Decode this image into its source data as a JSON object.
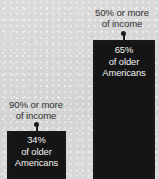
{
  "chart_data": {
    "type": "bar",
    "title": "",
    "subtitle": "",
    "xlabel": "",
    "ylabel": "",
    "grid": false,
    "legend_position": "none",
    "categories": [
      "90% or more of income",
      "50% or more of income"
    ],
    "values": [
      34,
      65
    ],
    "value_unit": "percent",
    "annotations": [
      "90% or more of income — 34% of older Americans",
      "50% or more of income — 65% of older Americans"
    ],
    "series": [
      {
        "name": "Share of older Americans",
        "values": [
          34,
          65
        ]
      }
    ],
    "bars": [
      {
        "id": "left",
        "callout": {
          "line1": "90% or more",
          "line2": "of income"
        },
        "value_label": "34%",
        "group_line1": "of older",
        "group_line2": "Americans",
        "value": 34
      },
      {
        "id": "right",
        "callout": {
          "line1": "50% or more",
          "line2": "of income"
        },
        "value_label": "65%",
        "group_line1": "of older",
        "group_line2": "Americans",
        "value": 65
      }
    ]
  },
  "colors": {
    "background": "#d8d8d8",
    "bar_fill": "#151515",
    "bar_text": "#f2f2f2",
    "callout_text": "#3a3a3a",
    "leader": "#1b1b1b"
  }
}
